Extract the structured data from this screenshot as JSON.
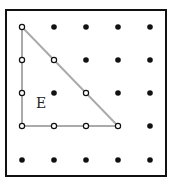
{
  "diagram": {
    "type": "geoboard",
    "grid": {
      "cols": 5,
      "rows": 5,
      "x": [
        22,
        54,
        86,
        118,
        150
      ],
      "y": [
        27,
        60,
        93,
        126,
        160
      ]
    },
    "frame": {
      "x": 6,
      "y": 10,
      "w": 160,
      "h": 166,
      "stroke": "#111111"
    },
    "shape": {
      "label": "E",
      "label_pos": {
        "x": 36,
        "y": 108
      },
      "vertices_grid": [
        [
          0,
          0
        ],
        [
          0,
          3
        ],
        [
          3,
          3
        ]
      ],
      "stroke": "#aaaaaa",
      "on_edge_dots": [
        [
          0,
          0
        ],
        [
          0,
          1
        ],
        [
          0,
          2
        ],
        [
          0,
          3
        ],
        [
          1,
          3
        ],
        [
          2,
          3
        ],
        [
          3,
          3
        ],
        [
          1,
          1
        ],
        [
          2,
          2
        ]
      ]
    },
    "dot_color": "#111111"
  }
}
